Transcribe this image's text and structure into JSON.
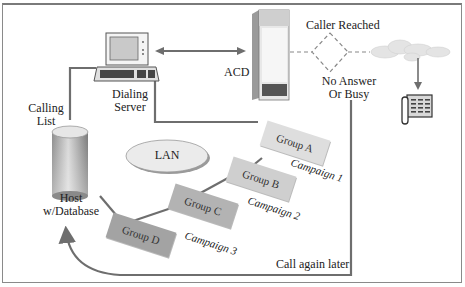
{
  "diagram": {
    "type": "network-flow",
    "title": "",
    "colors": {
      "line": "#6e6e6e",
      "group_a": "#dedede",
      "group_b": "#cfcfcf",
      "group_c": "#b3b3b3",
      "group_d": "#a3a3a3",
      "lan_fill": "#e8e8e8",
      "cloud_fill": "#e6e6e6"
    },
    "nodes": {
      "dialing_server": {
        "label_line1": "Dialing",
        "label_line2": "Server",
        "icon": "computer-icon"
      },
      "acd": {
        "label": "ACD",
        "icon": "server-cabinet-icon"
      },
      "caller_reached": {
        "label": "Caller Reached"
      },
      "no_answer": {
        "label_line1": "No Answer",
        "label_line2": "Or Busy"
      },
      "calling_list": {
        "label_line1": "Calling",
        "label_line2": "List"
      },
      "host": {
        "label_line1": "Host",
        "label_line2": "w/Database",
        "icon": "database-icon"
      },
      "lan": {
        "label": "LAN"
      },
      "cloud": {
        "icon": "cloud-icon"
      },
      "phone": {
        "icon": "telephone-icon"
      }
    },
    "groups": [
      {
        "label": "Group A",
        "campaign": "Campaign 1"
      },
      {
        "label": "Group B",
        "campaign": "Campaign 2"
      },
      {
        "label": "Group C",
        "campaign": "Campaign 3"
      },
      {
        "label": "Group D",
        "campaign": ""
      }
    ],
    "callback_label": "Call again later"
  }
}
